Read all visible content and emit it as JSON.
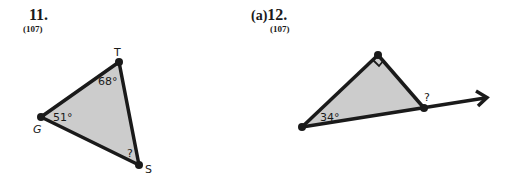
{
  "problems": [
    {
      "number": "11.",
      "reference": "(107)",
      "figure": {
        "vertices": {
          "T": "T",
          "G": "G",
          "S": "S"
        },
        "angles": {
          "T": "68°",
          "G": "51°",
          "S": "?"
        }
      }
    },
    {
      "prefix": "(a)",
      "number": "12.",
      "reference": "(107)",
      "figure": {
        "angles": {
          "left": "34°",
          "exterior": "?"
        },
        "right_angle_marker": true
      }
    }
  ],
  "colors": {
    "fill": "#cccccc",
    "stroke": "#1a1a1a"
  }
}
